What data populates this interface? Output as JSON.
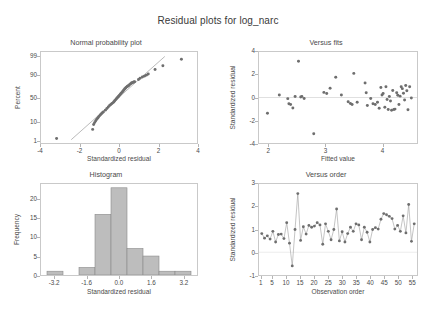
{
  "figure": {
    "title": "Residual plots for log_narc",
    "background": "#ffffff",
    "marker_color": "#6e6e6e",
    "frame_color": "#c9c9c9",
    "bar_fill": "#bdbdbd",
    "bar_edge": "#8a8a8a",
    "line_color": "#9a9a9a"
  },
  "chart_data": [
    {
      "type": "scatter",
      "panel": "normal-probability-plot",
      "title": "Normal probability plot",
      "xlabel": "Standardized residual",
      "ylabel": "Percent",
      "xlim": [
        -4,
        4
      ],
      "ylim": [
        0.6,
        99.5
      ],
      "yscale": "probability",
      "grid": false,
      "xticks": [
        -4,
        -2,
        0,
        2,
        4
      ],
      "xticklabels": [
        "-4",
        "-2",
        "0",
        "2",
        "4"
      ],
      "yticks": [
        1,
        10,
        50,
        90,
        99
      ],
      "yticklabels": [
        "1",
        "10",
        "50",
        "90",
        "99"
      ],
      "reference_line": {
        "x": [
          -2.45,
          2.35
        ],
        "y": [
          1.0,
          99.0
        ]
      },
      "x": [
        -3.2,
        -1.35,
        -1.3,
        -1.25,
        -1.2,
        -1.15,
        -1.1,
        -1.05,
        -1.0,
        -0.95,
        -0.9,
        -0.85,
        -0.8,
        -0.7,
        -0.62,
        -0.55,
        -0.48,
        -0.42,
        -0.36,
        -0.3,
        -0.26,
        -0.22,
        -0.18,
        -0.14,
        -0.1,
        -0.06,
        -0.02,
        0.02,
        0.06,
        0.1,
        0.14,
        0.18,
        0.22,
        0.26,
        0.3,
        0.34,
        0.38,
        0.42,
        0.46,
        0.5,
        0.55,
        0.6,
        0.64,
        0.68,
        0.72,
        0.76,
        0.8,
        1.0,
        1.08,
        1.2,
        1.3,
        1.4,
        1.5,
        1.85,
        2.25,
        3.2
      ],
      "y": [
        1.2,
        4.0,
        7.0,
        8.5,
        10.0,
        11.5,
        13.0,
        14.5,
        16.0,
        17.5,
        19.0,
        20.5,
        22.0,
        25.0,
        28.0,
        31.0,
        34.0,
        36.0,
        38.0,
        40.0,
        42.0,
        44.0,
        46.0,
        48.0,
        50.0,
        52.0,
        54.0,
        56.0,
        58.0,
        60.0,
        62.0,
        64.0,
        66.0,
        68.0,
        70.0,
        71.5,
        73.0,
        74.0,
        75.0,
        76.0,
        77.5,
        79.0,
        80.0,
        80.5,
        81.0,
        81.5,
        82.0,
        85.0,
        86.5,
        88.0,
        89.0,
        90.0,
        91.0,
        94.5,
        96.5,
        98.5
      ]
    },
    {
      "type": "scatter",
      "panel": "versus-fits",
      "title": "Versus fits",
      "xlabel": "Fitted value",
      "ylabel": "Standardized residual",
      "xlim": [
        1.82,
        4.62
      ],
      "ylim": [
        -4,
        4
      ],
      "grid": false,
      "xticks": [
        2,
        3,
        4
      ],
      "xticklabels": [
        "2",
        "3",
        "4"
      ],
      "yticks": [
        -4,
        -2,
        0,
        2,
        4
      ],
      "yticklabels": [
        "-4",
        "-2",
        "0",
        "2",
        "4"
      ],
      "zero_line": 0,
      "x": [
        1.97,
        2.18,
        2.33,
        2.35,
        2.38,
        2.42,
        2.46,
        2.52,
        2.56,
        2.58,
        2.62,
        2.79,
        2.97,
        3.02,
        3.08,
        3.18,
        3.28,
        3.4,
        3.44,
        3.47,
        3.5,
        3.56,
        3.7,
        3.72,
        3.74,
        3.8,
        3.84,
        3.88,
        3.92,
        3.95,
        3.98,
        4.0,
        4.02,
        4.05,
        4.07,
        4.09,
        4.11,
        4.13,
        4.15,
        4.17,
        4.19,
        4.21,
        4.23,
        4.26,
        4.28,
        4.3,
        4.32,
        4.34,
        4.36,
        4.38,
        4.4,
        4.42,
        4.44,
        4.46,
        4.49,
        4.52
      ],
      "y": [
        -1.38,
        0.22,
        -0.1,
        -0.55,
        -0.62,
        -0.92,
        0.08,
        3.18,
        0.05,
        0.08,
        -0.08,
        -3.18,
        0.45,
        0.35,
        0.82,
        1.78,
        0.22,
        -0.38,
        -0.52,
        -0.62,
        2.12,
        -0.42,
        1.28,
        0.42,
        -0.7,
        -0.08,
        -0.55,
        -0.62,
        -0.42,
        -0.95,
        0.88,
        0.22,
        0.35,
        -0.85,
        0.95,
        -0.18,
        -1.05,
        0.08,
        -0.3,
        -1.12,
        0.62,
        -1.05,
        -1.02,
        0.42,
        0.2,
        -0.62,
        0.12,
        0.95,
        0.78,
        0.38,
        -0.22,
        1.05,
        0.6,
        -1.08,
        0.95,
        -0.05
      ]
    },
    {
      "type": "bar",
      "panel": "histogram",
      "title": "Histogram",
      "xlabel": "Standardized residual",
      "ylabel": "Frequency",
      "xlim": [
        -3.9,
        3.9
      ],
      "ylim": [
        0,
        24
      ],
      "grid": false,
      "xticks": [
        -3.2,
        -1.6,
        0.0,
        1.6,
        3.2
      ],
      "xticklabels": [
        "-3.2",
        "-1.6",
        "0.0",
        "1.6",
        "3.2"
      ],
      "yticks": [
        0,
        5,
        10,
        15,
        20
      ],
      "yticklabels": [
        "0",
        "5",
        "10",
        "15",
        "20"
      ],
      "bin_edges": [
        -3.6,
        -2.8,
        -2.0,
        -1.2,
        -0.4,
        0.4,
        1.2,
        2.0,
        2.8,
        3.6
      ],
      "bin_centers": [
        -3.2,
        -2.4,
        -1.6,
        -0.8,
        0.0,
        0.8,
        1.6,
        2.4,
        3.2
      ],
      "values": [
        1,
        0,
        2,
        16,
        23,
        7,
        5,
        1,
        1
      ]
    },
    {
      "type": "line",
      "panel": "versus-order",
      "title": "Versus order",
      "xlabel": "Observation order",
      "ylabel": "Standardized residual",
      "xlim": [
        0,
        57
      ],
      "ylim": [
        -1,
        3
      ],
      "grid": false,
      "markers": true,
      "xticks": [
        1,
        5,
        10,
        15,
        20,
        25,
        30,
        35,
        40,
        45,
        50,
        55
      ],
      "xticklabels": [
        "1",
        "5",
        "10",
        "15",
        "20",
        "25",
        "30",
        "35",
        "40",
        "45",
        "50",
        "55"
      ],
      "yticks": [
        -1,
        0,
        1,
        2,
        3
      ],
      "yticklabels": [
        "-1",
        "0",
        "1",
        "2",
        "3"
      ],
      "x": [
        1,
        2,
        3,
        4,
        5,
        6,
        7,
        8,
        9,
        10,
        11,
        12,
        13,
        14,
        15,
        16,
        17,
        18,
        19,
        20,
        21,
        22,
        23,
        24,
        25,
        26,
        27,
        28,
        29,
        30,
        31,
        32,
        33,
        34,
        35,
        36,
        37,
        38,
        39,
        40,
        41,
        42,
        43,
        44,
        45,
        46,
        47,
        48,
        49,
        50,
        51,
        52,
        53,
        54,
        55,
        56
      ],
      "y": [
        0.82,
        0.62,
        0.72,
        0.58,
        0.92,
        0.45,
        0.78,
        0.8,
        0.6,
        1.3,
        0.4,
        -0.6,
        1.0,
        2.58,
        0.52,
        1.12,
        0.8,
        1.18,
        1.1,
        1.15,
        1.3,
        1.2,
        0.35,
        1.25,
        0.92,
        0.55,
        1.0,
        1.9,
        0.5,
        0.9,
        0.45,
        0.82,
        1.1,
        0.92,
        1.25,
        1.2,
        0.55,
        1.1,
        0.88,
        0.45,
        1.0,
        1.08,
        1.02,
        1.45,
        1.7,
        1.65,
        1.58,
        1.48,
        1.02,
        1.18,
        0.92,
        1.6,
        0.85,
        2.1,
        0.48,
        1.25
      ]
    }
  ]
}
